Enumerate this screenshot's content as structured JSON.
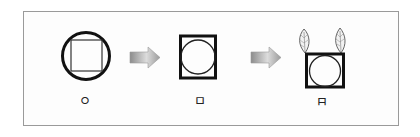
{
  "diagram": {
    "stages": [
      {
        "label": "ㅇ",
        "shape": "circle-with-inscribed-square"
      },
      {
        "label": "ㅁ",
        "shape": "square-with-inscribed-circle"
      },
      {
        "label": "ㅂ",
        "shape": "square-with-inscribed-circle-and-two-leaves",
        "label_rotated": true
      }
    ],
    "arrows": [
      {
        "from": 0,
        "to": 1
      },
      {
        "from": 1,
        "to": 2
      }
    ],
    "colors": {
      "stroke": "#111111",
      "frame": "#9a9a9a",
      "arrow_dark": "#8a8a8a",
      "arrow_light": "#e6e6e6"
    }
  }
}
